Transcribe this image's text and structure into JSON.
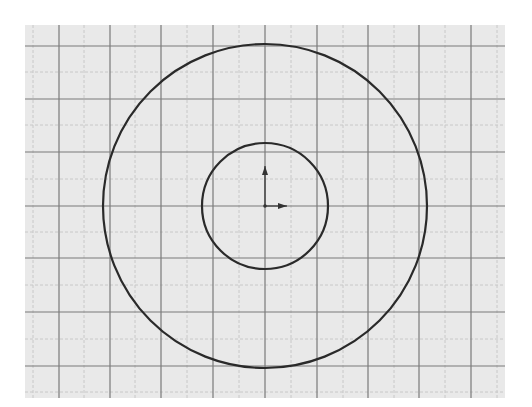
{
  "diagram": {
    "background_color": "#ffffff",
    "grid": {
      "left": 25,
      "top": 25,
      "right": 505,
      "bottom": 398,
      "fill": "#e9e9e9",
      "major_color": "#7a7a7a",
      "minor_color": "#c8c8c8",
      "vertical_major": [
        59,
        110,
        161,
        213,
        265,
        317,
        368,
        419,
        471
      ],
      "horizontal_major": [
        46,
        99,
        152,
        206,
        258,
        312,
        366
      ],
      "vertical_minor": [
        33,
        84,
        135,
        187,
        239,
        291,
        343,
        394,
        445,
        497
      ],
      "horizontal_minor": [
        72,
        125,
        179,
        232,
        285,
        339,
        392
      ]
    },
    "circles": [
      {
        "name": "outer-circle",
        "cx": 265,
        "cy": 206,
        "r": 162,
        "stroke": "#2a2a2a"
      },
      {
        "name": "inner-circle",
        "cx": 265,
        "cy": 206,
        "r": 63,
        "stroke": "#2a2a2a"
      }
    ],
    "origin": {
      "x": 265,
      "y": 206,
      "y_arrow_len": 40,
      "x_arrow_len": 22,
      "color": "#333333"
    }
  }
}
